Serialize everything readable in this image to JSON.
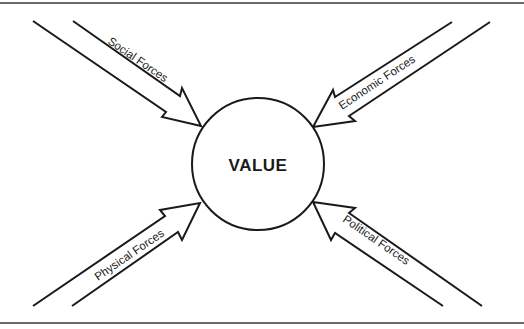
{
  "diagram": {
    "center": {
      "label": "VALUE"
    },
    "forces": [
      {
        "id": "social",
        "label": "Social Forces",
        "direction": "from top-left"
      },
      {
        "id": "economic",
        "label": "Economic Forces",
        "direction": "from top-right"
      },
      {
        "id": "physical",
        "label": "Physical Forces",
        "direction": "from bottom-left"
      },
      {
        "id": "political",
        "label": "Political Forces",
        "direction": "from bottom-right"
      }
    ]
  },
  "colors": {
    "stroke": "#1a1a1a",
    "background": "#ffffff",
    "rule": "#6a6a6a"
  }
}
